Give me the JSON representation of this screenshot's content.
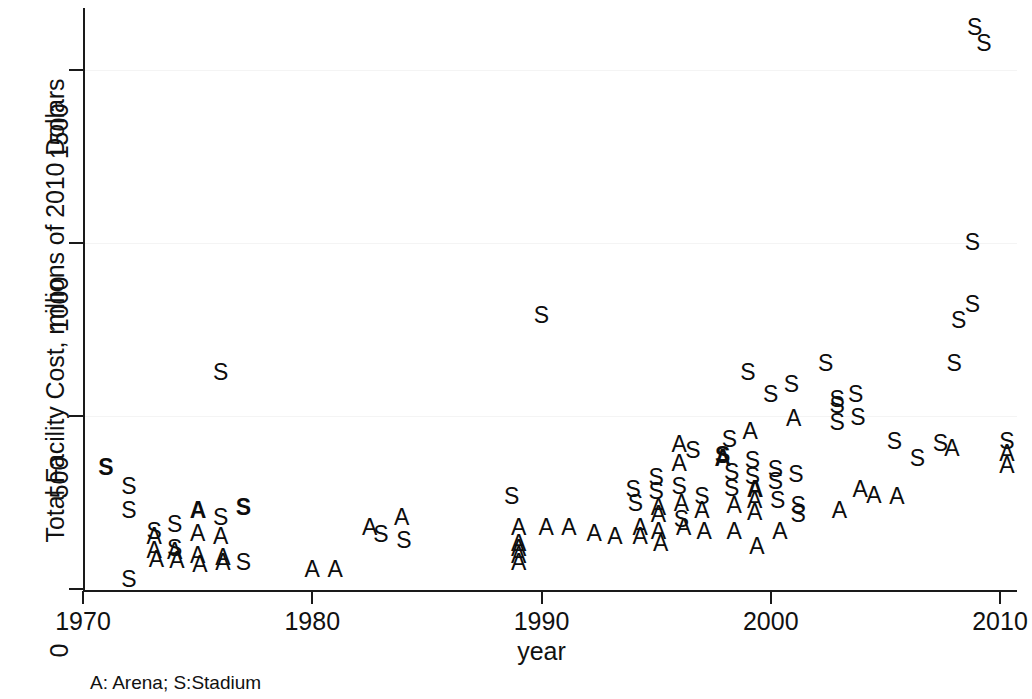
{
  "chart_data": {
    "type": "scatter",
    "title": "",
    "xlabel": "year",
    "ylabel": "Total Facility Cost, millions of 2010 Dollars",
    "footnote": "A: Arena; S:Stadium",
    "xlim": [
      1969.2,
      2011.0
    ],
    "ylim": [
      -40,
      1680
    ],
    "xticks": [
      1970,
      1980,
      1990,
      2000,
      2010
    ],
    "xtick_labels": [
      "1970",
      "1980",
      "1990",
      "2000",
      "2010"
    ],
    "yticks": [
      0,
      500,
      1000,
      1500
    ],
    "ytick_labels": [
      "0",
      "500",
      "1000",
      "1500"
    ],
    "grid": false,
    "legend": {
      "position": "below-axis",
      "entries": [
        {
          "marker": "A",
          "label": "Arena"
        },
        {
          "marker": "S",
          "label": "Stadium"
        }
      ]
    },
    "marker_series": [
      {
        "name": "Arena",
        "marker": "A"
      },
      {
        "name": "Stadium",
        "marker": "S"
      }
    ],
    "points": [
      {
        "x": 1971.0,
        "y": 350,
        "m": "S",
        "bold": true
      },
      {
        "x": 1972.0,
        "y": 295,
        "m": "S"
      },
      {
        "x": 1972.0,
        "y": 225,
        "m": "S"
      },
      {
        "x": 1972.0,
        "y": 25,
        "m": "S"
      },
      {
        "x": 1973.1,
        "y": 165,
        "m": "S"
      },
      {
        "x": 1973.1,
        "y": 150,
        "m": "A"
      },
      {
        "x": 1973.1,
        "y": 110,
        "m": "A"
      },
      {
        "x": 1973.2,
        "y": 85,
        "m": "A"
      },
      {
        "x": 1974.0,
        "y": 185,
        "m": "S"
      },
      {
        "x": 1974.0,
        "y": 115,
        "m": "S"
      },
      {
        "x": 1974.0,
        "y": 108,
        "m": "A"
      },
      {
        "x": 1974.1,
        "y": 80,
        "m": "A"
      },
      {
        "x": 1975.0,
        "y": 225,
        "m": "A",
        "bold": true
      },
      {
        "x": 1975.0,
        "y": 160,
        "m": "A"
      },
      {
        "x": 1975.0,
        "y": 95,
        "m": "A"
      },
      {
        "x": 1975.1,
        "y": 70,
        "m": "A"
      },
      {
        "x": 1976.0,
        "y": 625,
        "m": "S"
      },
      {
        "x": 1976.0,
        "y": 205,
        "m": "S"
      },
      {
        "x": 1976.0,
        "y": 150,
        "m": "A"
      },
      {
        "x": 1976.1,
        "y": 90,
        "m": "A"
      },
      {
        "x": 1976.1,
        "y": 75,
        "m": "A"
      },
      {
        "x": 1977.0,
        "y": 235,
        "m": "S",
        "bold": true
      },
      {
        "x": 1977.0,
        "y": 75,
        "m": "S"
      },
      {
        "x": 1980.0,
        "y": 55,
        "m": "A"
      },
      {
        "x": 1981.0,
        "y": 55,
        "m": "A"
      },
      {
        "x": 1982.5,
        "y": 175,
        "m": "A"
      },
      {
        "x": 1983.0,
        "y": 155,
        "m": "S"
      },
      {
        "x": 1983.9,
        "y": 205,
        "m": "A"
      },
      {
        "x": 1984.0,
        "y": 140,
        "m": "S"
      },
      {
        "x": 1988.7,
        "y": 265,
        "m": "S"
      },
      {
        "x": 1989.0,
        "y": 175,
        "m": "A"
      },
      {
        "x": 1989.0,
        "y": 130,
        "m": "A"
      },
      {
        "x": 1989.0,
        "y": 115,
        "m": "A"
      },
      {
        "x": 1989.0,
        "y": 95,
        "m": "A"
      },
      {
        "x": 1989.0,
        "y": 75,
        "m": "A"
      },
      {
        "x": 1990.0,
        "y": 790,
        "m": "S"
      },
      {
        "x": 1990.2,
        "y": 175,
        "m": "A"
      },
      {
        "x": 1991.2,
        "y": 175,
        "m": "A"
      },
      {
        "x": 1992.3,
        "y": 160,
        "m": "A"
      },
      {
        "x": 1993.2,
        "y": 150,
        "m": "A"
      },
      {
        "x": 1994.0,
        "y": 285,
        "m": "S"
      },
      {
        "x": 1994.1,
        "y": 245,
        "m": "S"
      },
      {
        "x": 1994.3,
        "y": 175,
        "m": "A"
      },
      {
        "x": 1994.3,
        "y": 150,
        "m": "A"
      },
      {
        "x": 1995.0,
        "y": 320,
        "m": "S"
      },
      {
        "x": 1995.0,
        "y": 280,
        "m": "S"
      },
      {
        "x": 1995.1,
        "y": 235,
        "m": "A"
      },
      {
        "x": 1995.1,
        "y": 215,
        "m": "A"
      },
      {
        "x": 1995.1,
        "y": 165,
        "m": "A"
      },
      {
        "x": 1995.2,
        "y": 130,
        "m": "A"
      },
      {
        "x": 1996.0,
        "y": 415,
        "m": "A"
      },
      {
        "x": 1996.0,
        "y": 360,
        "m": "A"
      },
      {
        "x": 1996.0,
        "y": 295,
        "m": "S"
      },
      {
        "x": 1996.1,
        "y": 245,
        "m": "A"
      },
      {
        "x": 1996.1,
        "y": 200,
        "m": "S"
      },
      {
        "x": 1996.2,
        "y": 175,
        "m": "A"
      },
      {
        "x": 1996.6,
        "y": 400,
        "m": "S"
      },
      {
        "x": 1997.0,
        "y": 265,
        "m": "S"
      },
      {
        "x": 1997.0,
        "y": 225,
        "m": "A"
      },
      {
        "x": 1997.1,
        "y": 165,
        "m": "A"
      },
      {
        "x": 1997.9,
        "y": 385,
        "m": "S",
        "bold": true
      },
      {
        "x": 1997.9,
        "y": 375,
        "m": "A",
        "bold": true
      },
      {
        "x": 1998.2,
        "y": 430,
        "m": "S"
      },
      {
        "x": 1998.3,
        "y": 335,
        "m": "S"
      },
      {
        "x": 1998.3,
        "y": 290,
        "m": "S"
      },
      {
        "x": 1998.4,
        "y": 240,
        "m": "A"
      },
      {
        "x": 1998.4,
        "y": 165,
        "m": "A"
      },
      {
        "x": 1999.0,
        "y": 625,
        "m": "S"
      },
      {
        "x": 1999.1,
        "y": 455,
        "m": "A"
      },
      {
        "x": 1999.2,
        "y": 370,
        "m": "S"
      },
      {
        "x": 1999.2,
        "y": 325,
        "m": "S"
      },
      {
        "x": 1999.3,
        "y": 285,
        "m": "A",
        "bold": true
      },
      {
        "x": 1999.3,
        "y": 255,
        "m": "A"
      },
      {
        "x": 1999.3,
        "y": 220,
        "m": "A"
      },
      {
        "x": 1999.4,
        "y": 120,
        "m": "A"
      },
      {
        "x": 2000.0,
        "y": 560,
        "m": "S"
      },
      {
        "x": 2000.2,
        "y": 345,
        "m": "S"
      },
      {
        "x": 2000.2,
        "y": 310,
        "m": "S"
      },
      {
        "x": 2000.3,
        "y": 255,
        "m": "S"
      },
      {
        "x": 2000.4,
        "y": 165,
        "m": "A"
      },
      {
        "x": 2000.9,
        "y": 590,
        "m": "S"
      },
      {
        "x": 2001.0,
        "y": 490,
        "m": "A"
      },
      {
        "x": 2001.1,
        "y": 330,
        "m": "S"
      },
      {
        "x": 2001.2,
        "y": 240,
        "m": "S"
      },
      {
        "x": 2001.2,
        "y": 215,
        "m": "S"
      },
      {
        "x": 2002.4,
        "y": 650,
        "m": "S"
      },
      {
        "x": 2002.9,
        "y": 545,
        "m": "S"
      },
      {
        "x": 2002.9,
        "y": 530,
        "m": "S"
      },
      {
        "x": 2002.9,
        "y": 480,
        "m": "S"
      },
      {
        "x": 2003.0,
        "y": 225,
        "m": "A"
      },
      {
        "x": 2003.7,
        "y": 560,
        "m": "S"
      },
      {
        "x": 2003.8,
        "y": 495,
        "m": "S"
      },
      {
        "x": 2003.9,
        "y": 285,
        "m": "A"
      },
      {
        "x": 2004.5,
        "y": 270,
        "m": "A"
      },
      {
        "x": 2005.4,
        "y": 425,
        "m": "S"
      },
      {
        "x": 2005.5,
        "y": 265,
        "m": "A"
      },
      {
        "x": 2006.4,
        "y": 375,
        "m": "S"
      },
      {
        "x": 2007.4,
        "y": 420,
        "m": "S"
      },
      {
        "x": 2007.9,
        "y": 405,
        "m": "A"
      },
      {
        "x": 2008.0,
        "y": 650,
        "m": "S"
      },
      {
        "x": 2008.2,
        "y": 775,
        "m": "S"
      },
      {
        "x": 2008.8,
        "y": 820,
        "m": "S"
      },
      {
        "x": 2008.8,
        "y": 1000,
        "m": "S"
      },
      {
        "x": 2008.9,
        "y": 1620,
        "m": "S"
      },
      {
        "x": 2009.3,
        "y": 1575,
        "m": "S"
      },
      {
        "x": 2010.3,
        "y": 425,
        "m": "S"
      },
      {
        "x": 2010.3,
        "y": 390,
        "m": "A"
      },
      {
        "x": 2010.3,
        "y": 355,
        "m": "A"
      }
    ]
  }
}
